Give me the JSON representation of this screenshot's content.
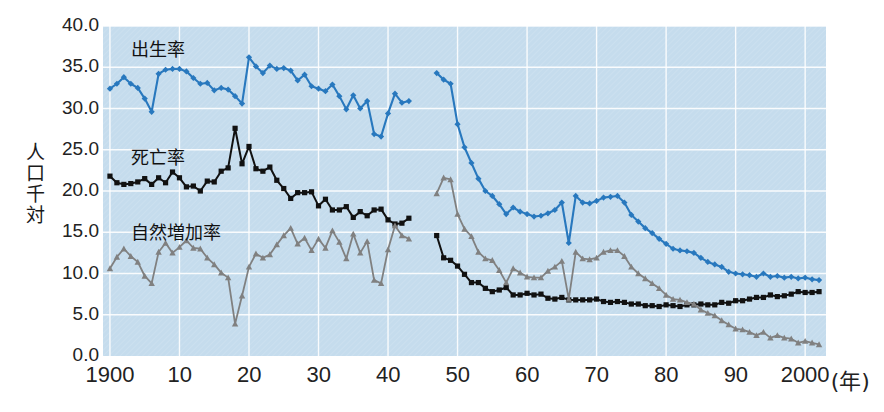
{
  "chart_data": {
    "type": "line",
    "title": "",
    "xlabel": "年",
    "ylabel": "人口千対",
    "xlim": [
      1899,
      2003
    ],
    "ylim": [
      0.0,
      40.0
    ],
    "grid": true,
    "legend_position": "inline-left",
    "y_ticks": [
      "0.0",
      "5.0",
      "10.0",
      "15.0",
      "20.0",
      "25.0",
      "30.0",
      "35.0",
      "40.0"
    ],
    "y_tick_values": [
      0,
      5,
      10,
      15,
      20,
      25,
      30,
      35,
      40
    ],
    "x_ticks": [
      "1900",
      "10",
      "20",
      "30",
      "40",
      "50",
      "60",
      "70",
      "80",
      "90",
      "2000"
    ],
    "x_tick_values": [
      1900,
      1910,
      1920,
      1930,
      1940,
      1950,
      1960,
      1970,
      1980,
      1990,
      2000
    ],
    "x_axis_suffix": "(年)",
    "gap_years": [
      1944,
      1945,
      1946
    ],
    "series": [
      {
        "name": "出生率",
        "color": "#2878be",
        "marker": "diamond",
        "label_x": 1903,
        "label_y": 37.6,
        "x": [
          1900,
          1901,
          1902,
          1903,
          1904,
          1905,
          1906,
          1907,
          1908,
          1909,
          1910,
          1911,
          1912,
          1913,
          1914,
          1915,
          1916,
          1917,
          1918,
          1919,
          1920,
          1921,
          1922,
          1923,
          1924,
          1925,
          1926,
          1927,
          1928,
          1929,
          1930,
          1931,
          1932,
          1933,
          1934,
          1935,
          1936,
          1937,
          1938,
          1939,
          1940,
          1941,
          1942,
          1943,
          1947,
          1948,
          1949,
          1950,
          1951,
          1952,
          1953,
          1954,
          1955,
          1956,
          1957,
          1958,
          1959,
          1960,
          1961,
          1962,
          1963,
          1964,
          1965,
          1966,
          1967,
          1968,
          1969,
          1970,
          1971,
          1972,
          1973,
          1974,
          1975,
          1976,
          1977,
          1978,
          1979,
          1980,
          1981,
          1982,
          1983,
          1984,
          1985,
          1986,
          1987,
          1988,
          1989,
          1990,
          1991,
          1992,
          1993,
          1994,
          1995,
          1996,
          1997,
          1998,
          1999,
          2000,
          2001,
          2002
        ],
        "values": [
          32.4,
          33.0,
          33.8,
          33.0,
          32.5,
          31.2,
          29.6,
          34.2,
          34.7,
          34.8,
          34.8,
          34.5,
          33.7,
          33.0,
          33.1,
          32.2,
          32.5,
          32.3,
          31.5,
          30.6,
          36.2,
          35.1,
          34.3,
          35.2,
          34.8,
          34.9,
          34.6,
          33.4,
          34.1,
          32.7,
          32.4,
          32.1,
          32.9,
          31.5,
          29.9,
          31.6,
          30.0,
          30.9,
          26.9,
          26.6,
          29.4,
          31.8,
          30.7,
          30.9,
          34.3,
          33.5,
          33.0,
          28.1,
          25.3,
          23.4,
          21.5,
          20.0,
          19.4,
          18.4,
          17.2,
          18.0,
          17.5,
          17.2,
          16.9,
          17.0,
          17.3,
          17.7,
          18.6,
          13.7,
          19.4,
          18.6,
          18.5,
          18.8,
          19.2,
          19.3,
          19.4,
          18.6,
          17.1,
          16.3,
          15.5,
          14.9,
          14.2,
          13.6,
          13.0,
          12.8,
          12.7,
          12.5,
          11.9,
          11.4,
          11.1,
          10.8,
          10.2,
          10.0,
          9.9,
          9.8,
          9.6,
          10.0,
          9.6,
          9.7,
          9.5,
          9.6,
          9.4,
          9.5,
          9.3,
          9.2
        ]
      },
      {
        "name": "死亡率",
        "color": "#111111",
        "marker": "square",
        "label_x": 1903,
        "label_y": 24.5,
        "x": [
          1900,
          1901,
          1902,
          1903,
          1904,
          1905,
          1906,
          1907,
          1908,
          1909,
          1910,
          1911,
          1912,
          1913,
          1914,
          1915,
          1916,
          1917,
          1918,
          1919,
          1920,
          1921,
          1922,
          1923,
          1924,
          1925,
          1926,
          1927,
          1928,
          1929,
          1930,
          1931,
          1932,
          1933,
          1934,
          1935,
          1936,
          1937,
          1938,
          1939,
          1940,
          1941,
          1942,
          1943,
          1947,
          1948,
          1949,
          1950,
          1951,
          1952,
          1953,
          1954,
          1955,
          1956,
          1957,
          1958,
          1959,
          1960,
          1961,
          1962,
          1963,
          1964,
          1965,
          1966,
          1967,
          1968,
          1969,
          1970,
          1971,
          1972,
          1973,
          1974,
          1975,
          1976,
          1977,
          1978,
          1979,
          1980,
          1981,
          1982,
          1983,
          1984,
          1985,
          1986,
          1987,
          1988,
          1989,
          1990,
          1991,
          1992,
          1993,
          1994,
          1995,
          1996,
          1997,
          1998,
          1999,
          2000,
          2001,
          2002
        ],
        "values": [
          21.8,
          21.0,
          20.8,
          20.9,
          21.1,
          21.5,
          20.8,
          21.6,
          21.0,
          22.3,
          21.6,
          20.5,
          20.6,
          20.0,
          21.2,
          21.1,
          22.4,
          22.8,
          27.6,
          23.3,
          25.4,
          22.7,
          22.4,
          22.9,
          21.3,
          20.3,
          19.1,
          19.8,
          19.8,
          19.9,
          18.2,
          19.0,
          17.7,
          17.7,
          18.1,
          16.8,
          17.5,
          17.0,
          17.7,
          17.8,
          16.5,
          16.0,
          16.1,
          16.7,
          14.6,
          11.9,
          11.6,
          10.9,
          9.9,
          8.9,
          8.9,
          8.2,
          7.8,
          8.0,
          8.3,
          7.4,
          7.4,
          7.6,
          7.4,
          7.5,
          7.0,
          6.9,
          7.1,
          6.8,
          6.8,
          6.8,
          6.8,
          6.9,
          6.6,
          6.5,
          6.6,
          6.5,
          6.3,
          6.3,
          6.1,
          6.1,
          6.0,
          6.2,
          6.1,
          6.0,
          6.2,
          6.2,
          6.3,
          6.2,
          6.2,
          6.5,
          6.4,
          6.7,
          6.7,
          6.9,
          7.1,
          7.1,
          7.4,
          7.2,
          7.3,
          7.5,
          7.8,
          7.7,
          7.7,
          7.8
        ]
      },
      {
        "name": "自然増加率",
        "color": "#808080",
        "marker": "triangle",
        "label_x": 1903,
        "label_y": 15.4,
        "x": [
          1900,
          1901,
          1902,
          1903,
          1904,
          1905,
          1906,
          1907,
          1908,
          1909,
          1910,
          1911,
          1912,
          1913,
          1914,
          1915,
          1916,
          1917,
          1918,
          1919,
          1920,
          1921,
          1922,
          1923,
          1924,
          1925,
          1926,
          1927,
          1928,
          1929,
          1930,
          1931,
          1932,
          1933,
          1934,
          1935,
          1936,
          1937,
          1938,
          1939,
          1940,
          1941,
          1942,
          1943,
          1947,
          1948,
          1949,
          1950,
          1951,
          1952,
          1953,
          1954,
          1955,
          1956,
          1957,
          1958,
          1959,
          1960,
          1961,
          1962,
          1963,
          1964,
          1965,
          1966,
          1967,
          1968,
          1969,
          1970,
          1971,
          1972,
          1973,
          1974,
          1975,
          1976,
          1977,
          1978,
          1979,
          1980,
          1981,
          1982,
          1983,
          1984,
          1985,
          1986,
          1987,
          1988,
          1989,
          1990,
          1991,
          1992,
          1993,
          1994,
          1995,
          1996,
          1997,
          1998,
          1999,
          2000,
          2001,
          2002
        ],
        "values": [
          10.6,
          12.0,
          13.0,
          12.1,
          11.4,
          9.7,
          8.8,
          12.6,
          13.7,
          12.5,
          13.2,
          14.0,
          13.1,
          13.0,
          11.9,
          11.1,
          10.1,
          9.5,
          3.9,
          7.3,
          10.8,
          12.4,
          11.9,
          12.3,
          13.5,
          14.6,
          15.5,
          13.6,
          14.3,
          12.8,
          14.2,
          13.1,
          15.2,
          13.8,
          11.8,
          14.8,
          12.5,
          13.9,
          9.2,
          8.8,
          12.9,
          15.8,
          14.6,
          14.2,
          19.7,
          21.6,
          21.4,
          17.2,
          15.4,
          14.5,
          12.6,
          11.8,
          11.6,
          10.4,
          8.9,
          10.6,
          10.1,
          9.6,
          9.5,
          9.5,
          10.3,
          10.8,
          11.5,
          6.9,
          12.6,
          11.8,
          11.7,
          11.9,
          12.6,
          12.8,
          12.8,
          12.1,
          10.8,
          10.0,
          9.4,
          8.8,
          8.2,
          7.4,
          6.9,
          6.8,
          6.5,
          6.3,
          5.6,
          5.2,
          4.9,
          4.3,
          3.8,
          3.3,
          3.2,
          2.9,
          2.5,
          2.9,
          2.2,
          2.5,
          2.2,
          2.1,
          1.6,
          1.8,
          1.6,
          1.4
        ]
      }
    ]
  },
  "axis_text": {
    "y_label": "人口千対",
    "x_suffix": "(年)"
  },
  "colors": {
    "plot_background": "#c5dced",
    "grid": "#ffffff",
    "birth_rate": "#2878be",
    "death_rate": "#111111",
    "natural_increase": "#808080",
    "text": "#1a1a1a"
  }
}
